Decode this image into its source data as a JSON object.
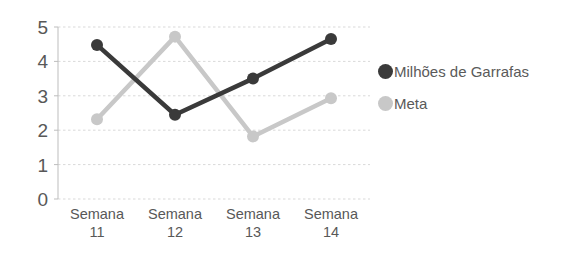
{
  "chart_data": {
    "type": "line",
    "title": "",
    "subtitle": "",
    "xlabel": "",
    "ylabel": "",
    "categories": [
      "Semana 11",
      "Semana 12",
      "Semana 13",
      "Semana 14"
    ],
    "category_lines": [
      {
        "name": "Semana",
        "num": "11"
      },
      {
        "name": "Semana",
        "num": "12"
      },
      {
        "name": "Semana",
        "num": "13"
      },
      {
        "name": "Semana",
        "num": "14"
      }
    ],
    "series": [
      {
        "name": "Milhões de Garrafas",
        "color": "#3a3a3a",
        "values": [
          4.48,
          2.45,
          3.5,
          4.65
        ]
      },
      {
        "name": "Meta",
        "color": "#c8c8c8",
        "values": [
          2.32,
          4.72,
          1.82,
          2.93
        ]
      }
    ],
    "ylim": [
      0,
      5
    ],
    "yticks": [
      5,
      4,
      3,
      2,
      1,
      0
    ],
    "ytick_labels": [
      "5",
      "4",
      "3",
      "2",
      "1",
      "0"
    ],
    "grid": true,
    "grid_color": "#d9d9d9",
    "axis_color": "#bdbdbd",
    "legend_position": "right",
    "marker": "circle",
    "background": "#ffffff"
  }
}
